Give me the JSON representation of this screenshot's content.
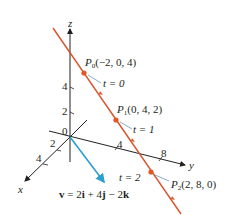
{
  "figure": {
    "axes": {
      "x_label": "x",
      "y_label": "y",
      "z_label": "z",
      "origin_label": "0",
      "x_ticks": [
        "2",
        "4"
      ],
      "y_ticks": [
        "4",
        "8"
      ],
      "z_ticks": [
        "2",
        "4"
      ]
    },
    "points": [
      {
        "name": "P",
        "sub": "0",
        "coords": "(−2, 0, 4)",
        "t_label": "t = 0"
      },
      {
        "name": "P",
        "sub": "1",
        "coords": "(0, 4, 2)",
        "t_label": "t = 1"
      },
      {
        "name": "P",
        "sub": "2",
        "coords": "(2, 8, 0)",
        "t_label": "t = 2"
      }
    ],
    "vector_label": "v = 2i + 4j − 2k",
    "vector_parts": {
      "v": "v",
      "eq": " = 2",
      "i": "i",
      "plus": " + 4",
      "j": "j",
      "minus": " − 2",
      "k": "k"
    },
    "colors": {
      "line": "#d9542b",
      "point": "#e0582a",
      "vector": "#2a9fd0",
      "axes": "#231f20",
      "leader": "#4a8fb5"
    }
  }
}
